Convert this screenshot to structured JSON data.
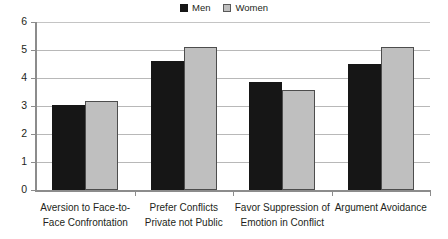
{
  "legend": {
    "position": "top-center",
    "entries": [
      {
        "label": "Men",
        "swatch": "men-swatch",
        "color": "#161616"
      },
      {
        "label": "Women",
        "swatch": "women-swatch",
        "color": "#bfbfbf"
      }
    ]
  },
  "axis": {
    "y_ticks": [
      "0",
      "1",
      "2",
      "3",
      "4",
      "5",
      "6"
    ]
  },
  "chart_data": {
    "type": "bar",
    "title": "",
    "subtitle": "",
    "xlabel": "",
    "ylabel": "",
    "ylim": [
      0,
      6
    ],
    "ytick_step": 1,
    "grid": true,
    "legend_position": "top-center",
    "categories": [
      "Aversion to Face-to-Face Confrontation",
      "Prefer Conflicts Private not Public",
      "Favor Suppression of Emotion in Conflict",
      "Argument Avoidance"
    ],
    "category_lines": [
      [
        "Aversion to Face-to-",
        "Face Confrontation"
      ],
      [
        "Prefer Conflicts",
        "Private not Public"
      ],
      [
        "Favor Suppression of",
        "Emotion in Conflict"
      ],
      [
        "Argument Avoidance",
        ""
      ]
    ],
    "series": [
      {
        "name": "Men",
        "color": "#161616",
        "values": [
          3.05,
          4.6,
          3.85,
          4.5
        ]
      },
      {
        "name": "Women",
        "color": "#bfbfbf",
        "values": [
          3.17,
          5.1,
          3.58,
          5.1
        ]
      }
    ]
  }
}
